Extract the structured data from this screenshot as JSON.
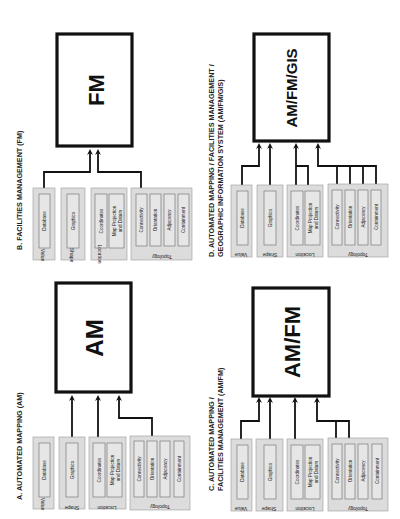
{
  "diagram": {
    "orientation": "rotated 90 degrees counter-clockwise",
    "groups": [
      {
        "name": "Value",
        "items": [
          "Database"
        ]
      },
      {
        "name": "Shape",
        "items": [
          "Graphics"
        ]
      },
      {
        "name": "Location",
        "items": [
          "Coordinates",
          "Map Projection and Datum"
        ]
      },
      {
        "name": "Topology",
        "items": [
          "Connectivity",
          "Orientation",
          "Adjacency",
          "Containment"
        ]
      }
    ],
    "panels": [
      {
        "id": "A",
        "title_lines": [
          "A. AUTOMATED MAPPING (AM)"
        ],
        "system": "AM",
        "connected_items": [
          "Graphics",
          "Coordinates",
          "Orientation"
        ]
      },
      {
        "id": "B",
        "title_lines": [
          "B. FACILITIES MANAGEMENT (FM)"
        ],
        "system": "FM",
        "connected_items": [
          "Database",
          "Connectivity"
        ]
      },
      {
        "id": "C",
        "title_lines": [
          "C. AUTOMATED MAPPING /",
          "FACILITIES MANAGEMENT (AM/FM)"
        ],
        "system": "AM/FM",
        "connected_items": [
          "Database",
          "Graphics",
          "Coordinates",
          "Connectivity",
          "Orientation"
        ]
      },
      {
        "id": "D",
        "title_lines": [
          "D. AUTOMATED MAPPING / FACILITIES MANAGEMENT /",
          "GEOGRAPHIC INFORMATION SYSTEM (AM/FM/GIS)"
        ],
        "system": "AM/FM/GIS",
        "connected_items": [
          "Database",
          "Graphics",
          "Coordinates",
          "Map Projection and Datum",
          "Connectivity",
          "Orientation",
          "Adjacency",
          "Containment"
        ]
      }
    ],
    "labels": {
      "value": "Value",
      "shape": "Shape",
      "location": "Location",
      "topology": "Topology",
      "database": "Database",
      "graphics": "Graphics",
      "coordinates": "Coordinates",
      "map_proj_1": "Map Projection",
      "map_proj_2": "and Datum",
      "connectivity": "Connectivity",
      "orientation": "Orientation",
      "adjacency": "Adjacency",
      "containment": "Containment"
    },
    "colors": {
      "group_fill": "#dcdcdc",
      "item_fill": "#e6e6e6",
      "line": "#111111",
      "background": "#ffffff"
    }
  }
}
